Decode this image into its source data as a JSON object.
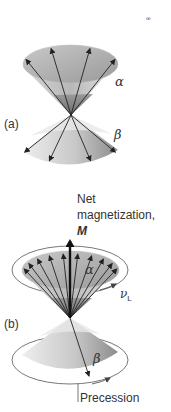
{
  "figure": {
    "corner_mark": "ꟹ",
    "panel_a": {
      "label": "(a)",
      "upper_state": "α",
      "lower_state": "β",
      "upper_arrow_count": 4,
      "lower_arrow_count": 4
    },
    "panel_b": {
      "label": "(b)",
      "net_magnetization_line1": "Net",
      "net_magnetization_line2": "magnetization,",
      "net_magnetization_symbol": "M",
      "upper_state": "α",
      "lower_state": "β",
      "larmor_symbol": "ν",
      "larmor_subscript": "L",
      "precession_label": "Precession",
      "upper_arrow_count": 10,
      "lower_arrow_count": 1
    },
    "colors": {
      "cone_light": "#e6e6e6",
      "cone_dark": "#8a8a8a",
      "arrow": "#222222",
      "text": "#333333",
      "orbit": "#555555"
    }
  }
}
